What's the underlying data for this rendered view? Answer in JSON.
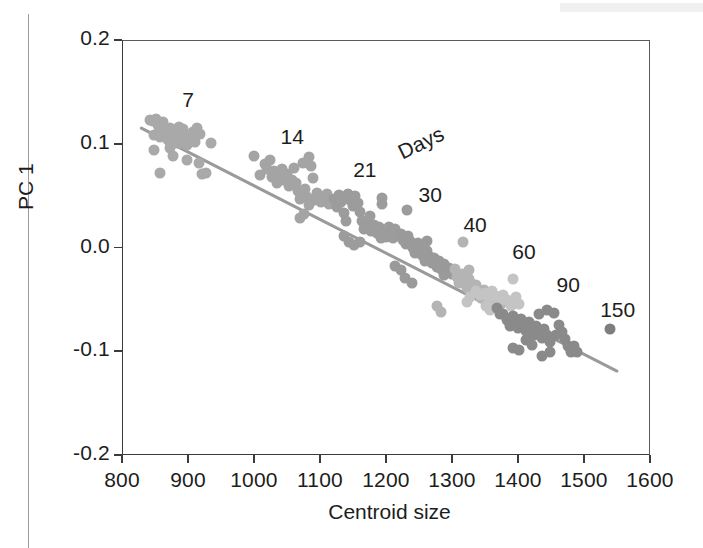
{
  "figure": {
    "axis_title_x": "Centroid size",
    "axis_title_y": "PC 1",
    "legend_title": "Days"
  },
  "chart_data": {
    "type": "scatter",
    "title": "",
    "xlabel": "Centroid size",
    "ylabel": "PC 1",
    "xlim": [
      800,
      1600
    ],
    "ylim": [
      -0.2,
      0.2
    ],
    "xticks": [
      800,
      900,
      1000,
      1100,
      1200,
      1300,
      1400,
      1500,
      1600
    ],
    "yticks": [
      0.2,
      0.1,
      0.0,
      -0.1,
      -0.2
    ],
    "xtick_labels": [
      "800",
      "900",
      "1000",
      "1100",
      "1200",
      "1300",
      "1400",
      "1500",
      "1600"
    ],
    "ytick_labels": [
      "0.2",
      "0.1",
      "0.0",
      "-0.1",
      "-0.2"
    ],
    "grid": false,
    "legend_position": "in-plot-annotations",
    "legend_title": "Days",
    "annotations": [
      {
        "text": "7",
        "x": 900,
        "y": 0.142
      },
      {
        "text": "14",
        "x": 1058,
        "y": 0.1065
      },
      {
        "text": "21",
        "x": 1168,
        "y": 0.0747
      },
      {
        "text": "Days",
        "x": 1253,
        "y": 0.101,
        "rotation": -26
      },
      {
        "text": "30",
        "x": 1267,
        "y": 0.0506
      },
      {
        "text": "40",
        "x": 1335,
        "y": 0.0217
      },
      {
        "text": "60",
        "x": 1409,
        "y": -0.0043
      },
      {
        "text": "90",
        "x": 1476,
        "y": -0.0361
      },
      {
        "text": "150",
        "x": 1551,
        "y": -0.0602
      }
    ],
    "trendline": {
      "x": [
        827,
        1551
      ],
      "y": [
        0.1153,
        -0.1199
      ],
      "color": "#9a9a9a"
    },
    "series": [
      {
        "name": "7",
        "color": "#a9a9a9",
        "points": [
          [
            843,
            0.123
          ],
          [
            847,
            0.1215
          ],
          [
            851,
            0.124
          ],
          [
            854,
            0.118
          ],
          [
            856,
            0.111
          ],
          [
            849,
            0.1085
          ],
          [
            858,
            0.1065
          ],
          [
            862,
            0.1205
          ],
          [
            865,
            0.1145
          ],
          [
            867,
            0.109
          ],
          [
            869,
            0.1035
          ],
          [
            872,
            0.115
          ],
          [
            874,
            0.1095
          ],
          [
            876,
            0.102
          ],
          [
            879,
            0.1125
          ],
          [
            881,
            0.106
          ],
          [
            884,
            0.101
          ],
          [
            886,
            0.116
          ],
          [
            889,
            0.1075
          ],
          [
            891,
            0.1005
          ],
          [
            848,
            0.0935
          ],
          [
            858,
            0.072
          ],
          [
            872,
            0.0955
          ],
          [
            877,
            0.088
          ],
          [
            893,
            0.114
          ],
          [
            896,
            0.1085
          ],
          [
            899,
            0.0985
          ],
          [
            903,
            0.1065
          ],
          [
            907,
            0.111
          ],
          [
            911,
            0.1015
          ],
          [
            914,
            0.1155
          ],
          [
            918,
            0.1095
          ],
          [
            898,
            0.084
          ],
          [
            916,
            0.081
          ],
          [
            921,
            0.0705
          ],
          [
            928,
            0.0715
          ],
          [
            935,
            0.101
          ]
        ]
      },
      {
        "name": "14",
        "color": "#a4a4a4",
        "points": [
          [
            1000,
            0.088
          ],
          [
            1009,
            0.07
          ],
          [
            1016,
            0.0805
          ],
          [
            1020,
            0.076
          ],
          [
            1024,
            0.084
          ],
          [
            1027,
            0.068
          ],
          [
            1031,
            0.0735
          ],
          [
            1035,
            0.0625
          ],
          [
            1038,
            0.069
          ],
          [
            1042,
            0.076
          ],
          [
            1046,
            0.0655
          ],
          [
            1050,
            0.071
          ],
          [
            1053,
            0.059
          ],
          [
            1057,
            0.0655
          ],
          [
            1060,
            0.077
          ],
          [
            1063,
            0.062
          ],
          [
            1067,
            0.054
          ],
          [
            1070,
            0.047
          ],
          [
            1074,
            0.081
          ],
          [
            1077,
            0.056
          ],
          [
            1081,
            0.049
          ],
          [
            1084,
            0.087
          ],
          [
            1087,
            0.079
          ],
          [
            1090,
            0.067
          ],
          [
            1093,
            0.0455
          ],
          [
            1096,
            0.053
          ],
          [
            1069,
            0.028
          ],
          [
            1075,
            0.032
          ],
          [
            1083,
            0.0405
          ],
          [
            1099,
            0.047
          ],
          [
            1102,
            0.044
          ],
          [
            1106,
            0.0465
          ],
          [
            1110,
            0.052
          ],
          [
            1113,
            0.042
          ],
          [
            1117,
            0.045
          ]
        ]
      },
      {
        "name": "21",
        "color": "#9c9c9c",
        "points": [
          [
            1121,
            0.047
          ],
          [
            1125,
            0.039
          ],
          [
            1129,
            0.051
          ],
          [
            1132,
            0.044
          ],
          [
            1136,
            0.033
          ],
          [
            1139,
            0.0255
          ],
          [
            1143,
            0.0515
          ],
          [
            1146,
            0.046
          ],
          [
            1150,
            0.04
          ],
          [
            1153,
            0.0495
          ],
          [
            1157,
            0.043
          ],
          [
            1160,
            0.034
          ],
          [
            1164,
            0.0255
          ],
          [
            1167,
            0.018
          ],
          [
            1171,
            0.0225
          ],
          [
            1175,
            0.0305
          ],
          [
            1178,
            0.016
          ],
          [
            1182,
            0.0215
          ],
          [
            1186,
            0.014
          ],
          [
            1189,
            0.0195
          ],
          [
            1193,
            0.0095
          ],
          [
            1196,
            0.016
          ],
          [
            1200,
            0.0105
          ],
          [
            1204,
            0.0195
          ],
          [
            1207,
            0.014
          ],
          [
            1211,
            0.009
          ],
          [
            1214,
            0.018
          ],
          [
            1218,
            0.0115
          ],
          [
            1137,
            0.011
          ],
          [
            1144,
            0.005
          ],
          [
            1152,
            0.002
          ],
          [
            1160,
            0.0055
          ],
          [
            1194,
            0.0475
          ],
          [
            1194,
            0.0415
          ],
          [
            1232,
            0.036
          ]
        ]
      },
      {
        "name": "30",
        "color": "#9a9a9a",
        "points": [
          [
            1222,
            0.013
          ],
          [
            1226,
            0.0075
          ],
          [
            1230,
            0.0035
          ],
          [
            1233,
            0.011
          ],
          [
            1237,
            0.006
          ],
          [
            1241,
            0.0
          ],
          [
            1244,
            -0.0055
          ],
          [
            1248,
            0.004
          ],
          [
            1252,
            -0.0015
          ],
          [
            1255,
            -0.007
          ],
          [
            1259,
            -0.013
          ],
          [
            1262,
            -0.0035
          ],
          [
            1266,
            -0.009
          ],
          [
            1270,
            -0.015
          ],
          [
            1273,
            -0.0105
          ],
          [
            1277,
            -0.0185
          ],
          [
            1281,
            -0.013
          ],
          [
            1284,
            -0.021
          ],
          [
            1288,
            -0.0155
          ],
          [
            1292,
            -0.023
          ],
          [
            1213,
            -0.018
          ],
          [
            1222,
            -0.0215
          ],
          [
            1229,
            -0.029
          ],
          [
            1240,
            -0.0345
          ],
          [
            1262,
            0.006
          ],
          [
            1288,
            -0.0265
          ],
          [
            1296,
            -0.02
          ],
          [
            1300,
            -0.0255
          ]
        ]
      },
      {
        "name": "40",
        "color": "#b4b4b4",
        "points": [
          [
            1304,
            -0.021
          ],
          [
            1308,
            -0.0285
          ],
          [
            1311,
            -0.034
          ],
          [
            1315,
            -0.026
          ],
          [
            1319,
            -0.032
          ],
          [
            1322,
            -0.039
          ],
          [
            1326,
            -0.03
          ],
          [
            1330,
            -0.0355
          ],
          [
            1333,
            -0.043
          ],
          [
            1337,
            -0.0365
          ],
          [
            1341,
            -0.0425
          ],
          [
            1344,
            -0.0485
          ],
          [
            1348,
            -0.0405
          ],
          [
            1352,
            -0.046
          ],
          [
            1355,
            -0.053
          ],
          [
            1359,
            -0.0445
          ],
          [
            1363,
            -0.05
          ],
          [
            1366,
            -0.057
          ],
          [
            1278,
            -0.056
          ],
          [
            1284,
            -0.0625
          ],
          [
            1316,
            0.005
          ],
          [
            1325,
            -0.022
          ],
          [
            1370,
            -0.049
          ],
          [
            1374,
            -0.0545
          ]
        ]
      },
      {
        "name": "60",
        "color": "#c4c4c4",
        "points": [
          [
            1336,
            -0.0415
          ],
          [
            1343,
            -0.046
          ],
          [
            1350,
            -0.044
          ],
          [
            1356,
            -0.049
          ],
          [
            1361,
            -0.0415
          ],
          [
            1367,
            -0.0465
          ],
          [
            1372,
            -0.052
          ],
          [
            1378,
            -0.0455
          ],
          [
            1383,
            -0.0505
          ],
          [
            1389,
            -0.056
          ],
          [
            1328,
            -0.048
          ],
          [
            1322,
            -0.053
          ],
          [
            1352,
            -0.0565
          ],
          [
            1358,
            -0.0605
          ],
          [
            1365,
            -0.057
          ],
          [
            1393,
            -0.03
          ],
          [
            1397,
            -0.048
          ],
          [
            1402,
            -0.054
          ]
        ]
      },
      {
        "name": "90",
        "color": "#8a8a8a",
        "points": [
          [
            1378,
            -0.064
          ],
          [
            1383,
            -0.07
          ],
          [
            1388,
            -0.0755
          ],
          [
            1392,
            -0.066
          ],
          [
            1396,
            -0.0715
          ],
          [
            1400,
            -0.0775
          ],
          [
            1404,
            -0.069
          ],
          [
            1408,
            -0.0745
          ],
          [
            1412,
            -0.0805
          ],
          [
            1416,
            -0.072
          ],
          [
            1420,
            -0.0775
          ],
          [
            1424,
            -0.084
          ],
          [
            1428,
            -0.0755
          ],
          [
            1432,
            -0.081
          ],
          [
            1436,
            -0.0875
          ],
          [
            1440,
            -0.079
          ],
          [
            1444,
            -0.0845
          ],
          [
            1448,
            -0.091
          ],
          [
            1368,
            -0.058
          ],
          [
            1372,
            -0.064
          ],
          [
            1393,
            -0.0965
          ],
          [
            1401,
            -0.0985
          ],
          [
            1412,
            -0.089
          ],
          [
            1421,
            -0.0935
          ],
          [
            1437,
            -0.1045
          ],
          [
            1449,
            -0.101
          ],
          [
            1457,
            -0.0845
          ],
          [
            1462,
            -0.0745
          ],
          [
            1467,
            -0.081
          ],
          [
            1471,
            -0.088
          ],
          [
            1476,
            -0.0945
          ],
          [
            1480,
            -0.101
          ],
          [
            1485,
            -0.095
          ],
          [
            1489,
            -0.1005
          ],
          [
            1455,
            -0.0635
          ],
          [
            1444,
            -0.06
          ],
          [
            1432,
            -0.0645
          ]
        ]
      },
      {
        "name": "150",
        "color": "#7e7e7e",
        "points": [
          [
            1540,
            -0.0785
          ]
        ]
      }
    ]
  }
}
